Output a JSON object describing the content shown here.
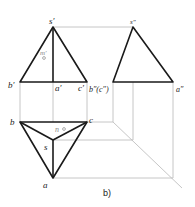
{
  "figure": {
    "caption": "b)",
    "colors": {
      "object": "#1a1a1a",
      "construction": "#b8b8b8",
      "point_label": "#222222",
      "aux_label": "#888888"
    },
    "front_view": {
      "labels": {
        "s": "s′",
        "b": "b′",
        "a": "a′",
        "c": "c′",
        "m": "m′"
      }
    },
    "side_view": {
      "labels": {
        "s": "s″",
        "bc": "b″(c″)",
        "a": "a″"
      }
    },
    "top_view": {
      "labels": {
        "b": "b",
        "c": "c",
        "s": "s",
        "a": "a",
        "n": "n"
      }
    }
  }
}
